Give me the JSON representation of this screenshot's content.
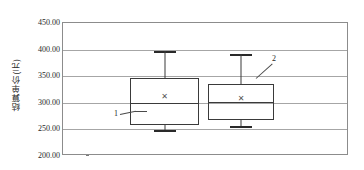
{
  "chart_data": {
    "type": "box",
    "title": "",
    "xlabel": "",
    "ylabel": "结算单价(元)",
    "ylim": [
      200,
      450
    ],
    "ytick_step": 50,
    "yticks": [
      "200.00",
      "250.00",
      "300.00",
      "350.00",
      "400.00",
      "450.00"
    ],
    "ytick_values": [
      200,
      250,
      300,
      350,
      400,
      450
    ],
    "grid": true,
    "legend": "none",
    "categories": [
      "1",
      "2"
    ],
    "series": [
      {
        "name": "1",
        "min": 248,
        "q1": 258,
        "median": 300,
        "q3": 347,
        "max": 398,
        "mean": 310
      },
      {
        "name": "2",
        "min": 256,
        "q1": 268,
        "median": 301,
        "q3": 335,
        "max": 391,
        "mean": 308
      }
    ],
    "annotations": [
      {
        "label": "1",
        "target": "box-1"
      },
      {
        "label": "2",
        "target": "box-2"
      }
    ],
    "mean_marker_glyph": "✕"
  },
  "axis": {
    "title": "结算单价(元)"
  },
  "ticks": {
    "t0": "450.00",
    "t1": "400.00",
    "t2": "350.00",
    "t3": "300.00",
    "t4": "250.00",
    "t5": "200.00"
  },
  "annotations": {
    "one": "1",
    "two": "2"
  },
  "markers": {
    "mean1": "✕",
    "mean2": "✕"
  }
}
